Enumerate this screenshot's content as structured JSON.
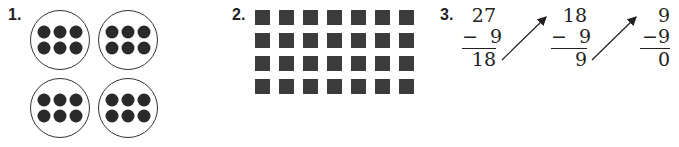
{
  "problems": [
    {
      "number": "1.",
      "type": "equal-groups",
      "groups": 4,
      "items_per_group": 6,
      "item_shape": "filled-circle"
    },
    {
      "number": "2.",
      "type": "array",
      "rows": 4,
      "columns": 7,
      "item_shape": "filled-square"
    },
    {
      "number": "3.",
      "type": "repeated-subtraction",
      "steps": [
        {
          "minuend": "27",
          "subtrahend": "−  9",
          "difference": "18"
        },
        {
          "minuend": "18",
          "subtrahend": "−  9",
          "difference": "9"
        },
        {
          "minuend": "9",
          "subtrahend": "−9",
          "difference": "0"
        }
      ],
      "arrows": 2
    }
  ],
  "colors": {
    "ink": "#231f20",
    "dot": "#2a2a2a",
    "square": "#3b3b3b"
  }
}
